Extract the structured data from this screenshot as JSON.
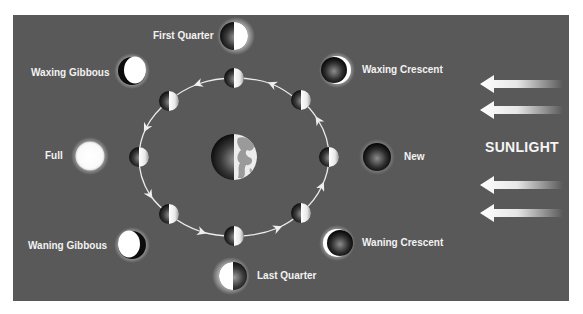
{
  "diagram": {
    "background_color": "#595959",
    "sunlight": {
      "label": "SUNLIGHT",
      "arrow_count": 4,
      "direction": "right-to-left"
    },
    "center": {
      "name": "Earth"
    },
    "orbit": {
      "direction": "counterclockwise",
      "positions": [
        "top",
        "upper-left",
        "left",
        "lower-left",
        "bottom",
        "lower-right",
        "right",
        "upper-right"
      ]
    },
    "phases": [
      {
        "id": "first-quarter",
        "label": "First Quarter"
      },
      {
        "id": "waxing-gibbous",
        "label": "Waxing Gibbous"
      },
      {
        "id": "full",
        "label": "Full"
      },
      {
        "id": "waning-gibbous",
        "label": "Waning Gibbous"
      },
      {
        "id": "last-quarter",
        "label": "Last Quarter"
      },
      {
        "id": "waning-crescent",
        "label": "Waning Crescent"
      },
      {
        "id": "new",
        "label": "New"
      },
      {
        "id": "waxing-crescent",
        "label": "Waxing Crescent"
      }
    ]
  }
}
